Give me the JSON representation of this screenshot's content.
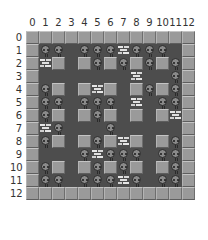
{
  "game": {
    "columns": [
      "0",
      "1",
      "2",
      "3",
      "4",
      "5",
      "6",
      "7",
      "8",
      "9",
      "10",
      "11",
      "12"
    ],
    "rows": [
      "0",
      "1",
      "2",
      "3",
      "4",
      "5",
      "6",
      "7",
      "8",
      "9",
      "10",
      "11",
      "12"
    ],
    "legend": {
      "W": "wall",
      "B": "brick",
      "E": "enemy",
      ".": "floor"
    },
    "grid": [
      "WWWWWWWWWWWWW",
      "WEE.EEEBEEE.W",
      "WBW.WEWEWEWEW",
      "W.......B..EW",
      "WEW.WBW.WEWEW",
      "WEE.EEE.B.EEW",
      "WEW.WEW.W.WBW",
      "WBE...E.....W",
      "WEW.WEWBW.WEW",
      "W...EBEEE.EEW",
      "WEW.WEWEW.WEW",
      "WEE.EEEBE.EEW",
      "WWWWWWWWWWWWW"
    ]
  }
}
